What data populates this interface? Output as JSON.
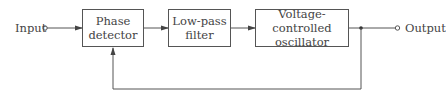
{
  "diagram": {
    "type": "block-diagram",
    "input_label": "Input",
    "output_label": "Output",
    "blocks": [
      {
        "id": "phase-detector",
        "line1": "Phase",
        "line2": "detector"
      },
      {
        "id": "low-pass-filter",
        "line1": "Low-pass",
        "line2": "filter"
      },
      {
        "id": "vco",
        "line1": "Voltage-controlled",
        "line2": "oscillator"
      }
    ],
    "connections": [
      {
        "from": "Input",
        "to": "Phase detector"
      },
      {
        "from": "Phase detector",
        "to": "Low-pass filter"
      },
      {
        "from": "Low-pass filter",
        "to": "Voltage-controlled oscillator"
      },
      {
        "from": "Voltage-controlled oscillator",
        "to": "Output"
      },
      {
        "from": "Voltage-controlled oscillator",
        "to": "Phase detector",
        "type": "feedback"
      }
    ],
    "colors": {
      "line": "#555555",
      "text": "#444444",
      "background": "#ffffff"
    }
  }
}
